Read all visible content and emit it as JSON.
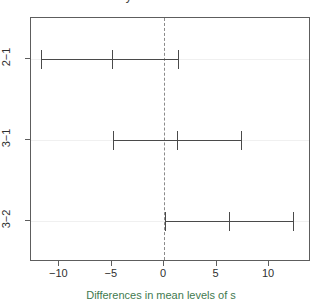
{
  "chart_data": {
    "type": "errorbar",
    "title": "95% family-wise confidence level",
    "xlabel": "Differences in mean levels of s",
    "ylabel": "",
    "orientation": "horizontal",
    "grid": false,
    "legend": null,
    "xlim": [
      -12.7,
      14.0
    ],
    "xticks": [
      -10,
      -5,
      0,
      5,
      10
    ],
    "xticklabels": [
      "−10",
      "−5",
      "0",
      "5",
      "10"
    ],
    "categories": [
      "2−1",
      "3−1",
      "3−2"
    ],
    "reference_line": {
      "x": 0,
      "style": "dashed",
      "color": "#8a8a8a"
    },
    "points": [
      {
        "label": "2−1",
        "diff": -5.0,
        "lwr": -11.7,
        "upr": 1.4
      },
      {
        "label": "3−1",
        "diff": 1.2,
        "lwr": -4.9,
        "upr": 7.4
      },
      {
        "label": "3−2",
        "diff": 6.2,
        "lwr": 0.1,
        "upr": 12.4
      }
    ]
  },
  "axis": {
    "xlabel": "Differences in mean levels of s",
    "xticklabels": [
      "−10",
      "−5",
      "0",
      "5",
      "10"
    ],
    "yticklabels": [
      "2−1",
      "3−1",
      "3−2"
    ]
  },
  "title": {
    "text": "95% family-wise confidence level"
  },
  "colors": {
    "axis": "#5d5d5d",
    "interval": "#4a4a4a",
    "reference": "#8a8a8a",
    "xlabel": "#3f7a4f",
    "gridline": "#f0f0f0",
    "background": "#ffffff"
  }
}
